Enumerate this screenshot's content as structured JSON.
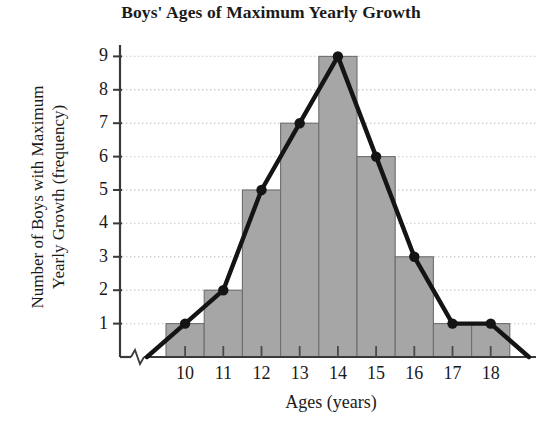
{
  "chart_data": {
    "type": "bar",
    "title": "Boys' Ages of Maximum Yearly Growth",
    "xlabel": "Ages (years)",
    "ylabel": "Number of Boys with Maximum\nYearly Growth (frequency)",
    "categories": [
      "10",
      "11",
      "12",
      "13",
      "14",
      "15",
      "16",
      "17",
      "18"
    ],
    "values": [
      1,
      2,
      5,
      7,
      9,
      6,
      3,
      1,
      1
    ],
    "series": [
      {
        "name": "Histogram",
        "type": "bar",
        "values": [
          1,
          2,
          5,
          7,
          9,
          6,
          3,
          1,
          1
        ]
      },
      {
        "name": "Frequency polygon",
        "type": "line",
        "x": [
          "9",
          "10",
          "11",
          "12",
          "13",
          "14",
          "15",
          "16",
          "17",
          "18",
          "19"
        ],
        "values": [
          0,
          1,
          2,
          5,
          7,
          9,
          6,
          3,
          1,
          1,
          0
        ],
        "markers": true
      }
    ],
    "ylim": [
      0,
      9.7
    ],
    "yticks": [
      1,
      2,
      3,
      4,
      5,
      6,
      7,
      8,
      9
    ],
    "ytick_labels": [
      "1",
      "2",
      "3",
      "4",
      "5",
      "6",
      "7",
      "8",
      "9"
    ],
    "xtick_labels": [
      "10",
      "11",
      "12",
      "13",
      "14",
      "15",
      "16",
      "17",
      "18"
    ],
    "grid": "horizontal-dotted",
    "legend": "none",
    "axis_break": "x-axis near origin",
    "colors": {
      "bar_fill": "#a6a6a6",
      "bar_edge": "#6e6e6e",
      "line": "#141414",
      "marker": "#141414",
      "axis": "#3a3a3a",
      "grid": "#cfcfcf",
      "text": "#1a1a1a",
      "background": "#ffffff"
    }
  },
  "axis": {
    "y_ticks": [
      {
        "label": "9"
      },
      {
        "label": "8"
      },
      {
        "label": "7"
      },
      {
        "label": "6"
      },
      {
        "label": "5"
      },
      {
        "label": "4"
      },
      {
        "label": "3"
      },
      {
        "label": "2"
      },
      {
        "label": "1"
      }
    ],
    "x_ticks": [
      {
        "label": "10"
      },
      {
        "label": "11"
      },
      {
        "label": "12"
      },
      {
        "label": "13"
      },
      {
        "label": "14"
      },
      {
        "label": "15"
      },
      {
        "label": "16"
      },
      {
        "label": "17"
      },
      {
        "label": "18"
      }
    ]
  }
}
